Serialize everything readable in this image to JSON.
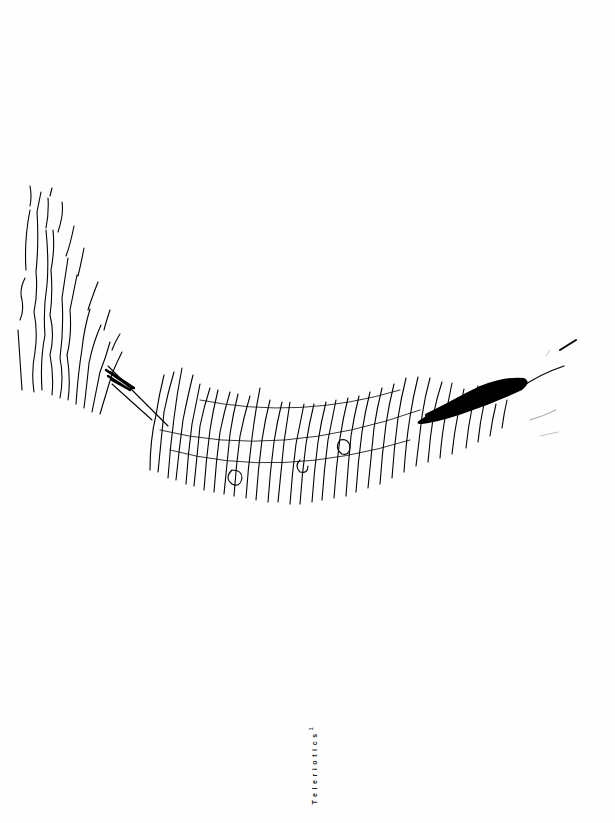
{
  "page": {
    "background": "#ffffff",
    "ink_color": "#000000"
  },
  "artwork": {
    "description": "handwritten-text-arc",
    "fragments": [
      "TO LEAN MY DIALECTIC",
      "WHAT DID I DISTINGUISH",
      "THE OBJECT OF THE OTHER",
      "IN THE MOMENT",
      "THE LOAD AND HAND",
      "INSIDE THE CLARITY"
    ]
  },
  "caption": {
    "title": "Teleriotics",
    "superscript": "1"
  },
  "edge_text": "· · · · · · · · · · · ·"
}
